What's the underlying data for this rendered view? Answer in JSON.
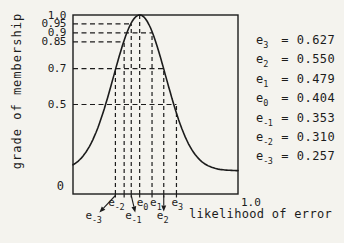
{
  "figure": {
    "background": "#f4f3ee",
    "ink": "#1c1c1c",
    "ylabel": "grade of membership",
    "xlabel": "likelihood of error",
    "origin_label": "0",
    "x_end_tick_label": "1.0"
  },
  "chart_data": {
    "type": "line",
    "title": "",
    "xlabel": "likelihood of error",
    "ylabel": "grade of membership",
    "xlim": [
      0,
      1.0
    ],
    "ylim": [
      0,
      1.0
    ],
    "grid": "dashed construction lines only",
    "legend": "none",
    "y_tick_labels": [
      "1.0",
      "0.95",
      "0.9",
      "0.85",
      "0.7",
      "0.5"
    ],
    "x_tick_labels": [
      "0",
      "1.0"
    ],
    "dashed_grade_levels": [
      0.95,
      0.9,
      0.85,
      0.7,
      0.5
    ],
    "curve": {
      "shape": "bell",
      "peak_x": 0.404,
      "peak_grade": 1.0,
      "sigma": 0.158,
      "tail_baseline": 0.13
    },
    "points": [
      {
        "base": "e",
        "sub": "3",
        "x": 0.627,
        "grade": 0.5,
        "label_row": "near",
        "has_arrow": false
      },
      {
        "base": "e",
        "sub": "2",
        "x": 0.55,
        "grade": 0.7,
        "label_row": "far",
        "has_arrow": true
      },
      {
        "base": "e",
        "sub": "1",
        "x": 0.479,
        "grade": 0.9,
        "label_row": "near",
        "has_arrow": false
      },
      {
        "base": "e",
        "sub": "0",
        "x": 0.404,
        "grade": 1.0,
        "label_row": "near",
        "has_arrow": false
      },
      {
        "base": "e",
        "sub": "-1",
        "x": 0.353,
        "grade": 0.95,
        "label_row": "far",
        "has_arrow": true
      },
      {
        "base": "e",
        "sub": "-2",
        "x": 0.31,
        "grade": 0.85,
        "label_row": "near",
        "has_arrow": false
      },
      {
        "base": "e",
        "sub": "-3",
        "x": 0.257,
        "grade": 0.7,
        "label_row": "far",
        "has_arrow": true
      }
    ],
    "equals_sign": "=",
    "value_list": [
      {
        "base": "e",
        "sub": "3",
        "value": "0.627"
      },
      {
        "base": "e",
        "sub": "2",
        "value": "0.550"
      },
      {
        "base": "e",
        "sub": "1",
        "value": "0.479"
      },
      {
        "base": "e",
        "sub": "0",
        "value": "0.404"
      },
      {
        "base": "e",
        "sub": "-1",
        "value": "0.353"
      },
      {
        "base": "e",
        "sub": "-2",
        "value": "0.310"
      },
      {
        "base": "e",
        "sub": "-3",
        "value": "0.257"
      }
    ]
  }
}
